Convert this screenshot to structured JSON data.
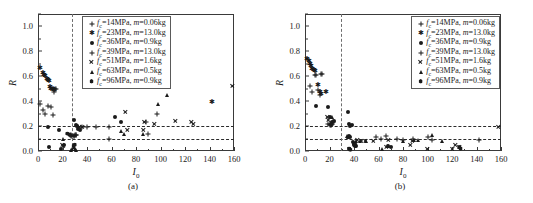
{
  "figure": {
    "panels": [
      {
        "caption": "(a)"
      },
      {
        "caption": "(b)"
      }
    ]
  },
  "axes": {
    "ylabel": "R",
    "xlabel_main": "I",
    "xlabel_sub": "0",
    "yticks": [
      "0.0",
      "0.2",
      "0.4",
      "0.6",
      "0.8",
      "1.0"
    ],
    "ytick_values": [
      0.0,
      0.2,
      0.4,
      0.6,
      0.8,
      1.0
    ],
    "xticks": [
      "0",
      "20",
      "40",
      "60",
      "80",
      "100",
      "120",
      "140",
      "160"
    ],
    "xtick_values": [
      0,
      20,
      40,
      60,
      80,
      100,
      120,
      140,
      160
    ],
    "xlim": [
      0,
      160
    ],
    "ylim": [
      0.0,
      1.1
    ]
  },
  "legend": {
    "entries": [
      {
        "marker": "plus",
        "fc_label": "f",
        "fc_sub": "c",
        "text": "=14MPa, ",
        "m_italic": "m",
        "m_text": "=0.06kg"
      },
      {
        "marker": "star",
        "fc_label": "f",
        "fc_sub": "c",
        "text": "=23MPa, ",
        "m_italic": "m",
        "m_text": "=13.0kg"
      },
      {
        "marker": "circle",
        "fc_label": "f",
        "fc_sub": "c",
        "text": "=36MPa, ",
        "m_italic": "m",
        "m_text": "=0.9kg"
      },
      {
        "marker": "plus",
        "fc_label": "f",
        "fc_sub": "c",
        "text": "=39MPa, ",
        "m_italic": "m",
        "m_text": "=13.0kg"
      },
      {
        "marker": "cross",
        "fc_label": "f",
        "fc_sub": "c",
        "text": "=51MPa, ",
        "m_italic": "m",
        "m_text": "=1.6kg"
      },
      {
        "marker": "tri",
        "fc_label": "f",
        "fc_sub": "c",
        "text": "=63MPa, ",
        "m_italic": "m",
        "m_text": "=0.5kg"
      },
      {
        "marker": "hex",
        "fc_label": "f",
        "fc_sub": "c",
        "text": "=96MPa, ",
        "m_italic": "m",
        "m_text": "=0.9kg"
      }
    ]
  },
  "chart_data": [
    {
      "type": "scatter",
      "title": "(a)",
      "xlabel": "I0",
      "ylabel": "R",
      "xlim": [
        0,
        160
      ],
      "ylim": [
        0.0,
        1.1
      ],
      "grid": false,
      "legend_position": "top-center",
      "reference_lines": {
        "horizontal": [
          0.2,
          0.1
        ],
        "vertical": [
          28
        ]
      },
      "series": [
        {
          "name": "fc=14MPa, m=0.06kg",
          "marker": "plus",
          "points": [
            [
              2,
              0.38
            ],
            [
              4,
              0.33
            ],
            [
              6,
              0.3
            ],
            [
              8,
              0.36
            ],
            [
              11,
              0.35
            ],
            [
              12,
              0.29
            ],
            [
              13,
              0.47
            ],
            [
              14,
              0.5
            ],
            [
              15,
              0.5
            ],
            [
              26,
              0.13
            ],
            [
              27,
              0.12
            ],
            [
              28,
              0.12
            ],
            [
              29,
              0.12
            ],
            [
              30,
              0.13
            ],
            [
              31,
              0.13
            ],
            [
              33,
              0.19
            ],
            [
              36,
              0.19
            ],
            [
              40,
              0.19
            ],
            [
              47,
              0.19
            ],
            [
              58,
              0.1
            ],
            [
              58,
              0.19
            ],
            [
              88,
              0.23
            ],
            [
              90,
              0.14
            ],
            [
              97,
              0.3
            ]
          ]
        },
        {
          "name": "fc=23MPa, m=13.0kg",
          "marker": "star",
          "points": [
            [
              2,
              0.67
            ],
            [
              4,
              0.63
            ],
            [
              5,
              0.61
            ],
            [
              6,
              0.6
            ],
            [
              7,
              0.58
            ],
            [
              8,
              0.57
            ],
            [
              9,
              0.56
            ],
            [
              10,
              0.51
            ],
            [
              11,
              0.5
            ],
            [
              12,
              0.5
            ],
            [
              13,
              0.49
            ],
            [
              142,
              0.39
            ]
          ]
        },
        {
          "name": "fc=36MPa, m=0.9kg",
          "marker": "circle",
          "points": [
            [
              8,
              0.19
            ],
            [
              9,
              0.03
            ],
            [
              17,
              0.17
            ],
            [
              19,
              0.02
            ],
            [
              21,
              0.05
            ],
            [
              29,
              0.25
            ],
            [
              31,
              0.21
            ],
            [
              32,
              0.2
            ],
            [
              33,
              0.18
            ],
            [
              34,
              0.17
            ],
            [
              63,
              0.27
            ],
            [
              68,
              0.23
            ]
          ]
        },
        {
          "name": "fc=39MPa, m=13.0kg",
          "marker": "plus",
          "points": [
            [
              27,
              0.13
            ],
            [
              29,
              0.12
            ],
            [
              31,
              0.13
            ]
          ]
        },
        {
          "name": "fc=51MPa, m=1.6kg",
          "marker": "cross",
          "points": [
            [
              20,
              0.05
            ],
            [
              21,
              0.04
            ],
            [
              34,
              0.19
            ],
            [
              36,
              0.19
            ],
            [
              71,
              0.31
            ],
            [
              73,
              0.17
            ],
            [
              86,
              0.17
            ],
            [
              87,
              0.23
            ],
            [
              95,
              0.22
            ],
            [
              112,
              0.24
            ],
            [
              125,
              0.23
            ],
            [
              127,
              0.22
            ],
            [
              159,
              0.52
            ]
          ]
        },
        {
          "name": "fc=63MPa, m=0.5kg",
          "marker": "tri",
          "points": [
            [
              20,
              0.1
            ],
            [
              27,
              0.01
            ],
            [
              28,
              0.02
            ],
            [
              29,
              0.03
            ],
            [
              30,
              0.02
            ],
            [
              31,
              0.01
            ],
            [
              68,
              0.16
            ],
            [
              70,
              0.14
            ],
            [
              86,
              0.14
            ],
            [
              98,
              0.38
            ],
            [
              105,
              0.45
            ]
          ]
        },
        {
          "name": "fc=96MPa, m=0.9kg",
          "marker": "hex",
          "points": [
            [
              24,
              0.14
            ],
            [
              26,
              0.13
            ],
            [
              29,
              0.04
            ],
            [
              30,
              0.05
            ]
          ]
        }
      ]
    },
    {
      "type": "scatter",
      "title": "(b)",
      "xlabel": "I0",
      "ylabel": "R",
      "xlim": [
        0,
        160
      ],
      "ylim": [
        0.0,
        1.1
      ],
      "grid": false,
      "legend_position": "top-right",
      "reference_lines": {
        "horizontal": [
          0.2,
          0.1
        ],
        "vertical": [
          29
        ]
      },
      "series": [
        {
          "name": "fc=14MPa, m=0.06kg",
          "marker": "plus",
          "points": [
            [
              4,
              0.52
            ],
            [
              6,
              0.47
            ],
            [
              8,
              0.61
            ],
            [
              9,
              0.61
            ],
            [
              11,
              0.49
            ],
            [
              12,
              0.45
            ],
            [
              13,
              0.62
            ],
            [
              14,
              0.62
            ],
            [
              19,
              0.22
            ],
            [
              20,
              0.21
            ],
            [
              21,
              0.21
            ],
            [
              22,
              0.22
            ],
            [
              23,
              0.23
            ],
            [
              58,
              0.11
            ],
            [
              62,
              0.1
            ],
            [
              66,
              0.12
            ],
            [
              75,
              0.1
            ],
            [
              80,
              0.09
            ],
            [
              88,
              0.1
            ],
            [
              100,
              0.11
            ],
            [
              104,
              0.09
            ],
            [
              142,
              0.09
            ]
          ]
        },
        {
          "name": "fc=23MPa, m=13.0kg",
          "marker": "star",
          "points": [
            [
              2,
              0.74
            ],
            [
              3,
              0.72
            ],
            [
              4,
              0.7
            ],
            [
              5,
              0.68
            ],
            [
              6,
              0.66
            ],
            [
              7,
              0.65
            ],
            [
              8,
              0.64
            ],
            [
              11,
              0.53
            ],
            [
              12,
              0.47
            ],
            [
              13,
              0.46
            ],
            [
              17,
              0.47
            ]
          ]
        },
        {
          "name": "fc=36MPa, m=0.9kg",
          "marker": "circle",
          "points": [
            [
              9,
              0.36
            ],
            [
              19,
              0.35
            ],
            [
              20,
              0.27
            ],
            [
              22,
              0.23
            ],
            [
              24,
              0.24
            ],
            [
              35,
              0.31
            ],
            [
              36,
              0.22
            ],
            [
              37,
              0.2
            ],
            [
              38,
              0.21
            ],
            [
              36,
              0.12
            ],
            [
              37,
              0.11
            ],
            [
              39,
              0.07
            ],
            [
              40,
              0.05
            ],
            [
              41,
              0.04
            ],
            [
              42,
              0.04
            ],
            [
              68,
              0.04
            ],
            [
              70,
              0.03
            ]
          ]
        },
        {
          "name": "fc=39MPa, m=13.0kg",
          "marker": "plus",
          "points": [
            [
              20,
              0.22
            ],
            [
              21,
              0.21
            ],
            [
              22,
              0.22
            ]
          ]
        },
        {
          "name": "fc=51MPa, m=1.6kg",
          "marker": "cross",
          "points": [
            [
              18,
              0.27
            ],
            [
              19,
              0.25
            ],
            [
              43,
              0.09
            ],
            [
              46,
              0.08
            ],
            [
              49,
              0.08
            ],
            [
              56,
              0.08
            ],
            [
              66,
              0.03
            ],
            [
              68,
              0.09
            ],
            [
              86,
              0.05
            ],
            [
              88,
              0.08
            ],
            [
              100,
              0.02
            ],
            [
              120,
              0.02
            ],
            [
              123,
              0.05
            ],
            [
              126,
              0.03
            ],
            [
              158,
              0.19
            ]
          ]
        },
        {
          "name": "fc=63MPa, m=0.5kg",
          "marker": "tri",
          "points": [
            [
              22,
              0.27
            ],
            [
              34,
              0.12
            ],
            [
              35,
              0.11
            ],
            [
              42,
              0.08
            ],
            [
              45,
              0.08
            ],
            [
              50,
              0.08
            ],
            [
              63,
              0.02
            ],
            [
              68,
              0.04
            ],
            [
              80,
              0.08
            ],
            [
              89,
              0.09
            ],
            [
              92,
              0.09
            ],
            [
              104,
              0.13
            ],
            [
              112,
              0.08
            ]
          ]
        },
        {
          "name": "fc=96MPa, m=0.9kg",
          "marker": "hex",
          "points": [
            [
              36,
              0.02
            ],
            [
              37,
              0.01
            ],
            [
              40,
              0.06
            ],
            [
              41,
              0.05
            ],
            [
              126,
              0.03
            ],
            [
              127,
              0.02
            ]
          ]
        }
      ]
    }
  ]
}
